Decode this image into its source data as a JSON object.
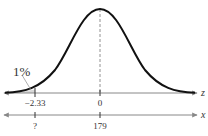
{
  "figure": {
    "type": "normal-distribution-diagram",
    "percent_label": "1%",
    "z_axis": {
      "label": "z",
      "ticks": [
        {
          "value": "−2.33",
          "pos": 35
        },
        {
          "value": "0",
          "pos": 100
        }
      ]
    },
    "x_axis": {
      "label": "x",
      "ticks": [
        {
          "value": "?",
          "pos": 35
        },
        {
          "value": "179",
          "pos": 100
        }
      ]
    },
    "colors": {
      "curve": "#111111",
      "axis": "#888888",
      "text": "#333333"
    }
  }
}
